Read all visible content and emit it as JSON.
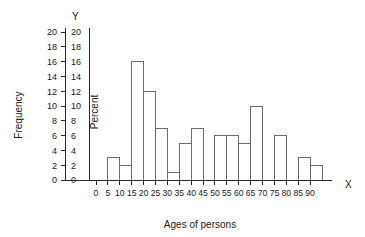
{
  "chart_data": {
    "type": "bar",
    "title": "",
    "subtitle": "",
    "xlabel": "Ages of persons",
    "ylabel": "Frequency",
    "y2label": "Percent",
    "x_axis_letter": "X",
    "y_axis_letter": "Y",
    "grid": false,
    "legend": "none",
    "xlim": [
      0,
      95
    ],
    "ylim": [
      0,
      20
    ],
    "y2lim": [
      0,
      20
    ],
    "x_ticks": [
      0,
      5,
      10,
      15,
      20,
      25,
      30,
      35,
      40,
      45,
      50,
      55,
      60,
      65,
      70,
      75,
      80,
      85,
      90
    ],
    "x_tick_labels": [
      "0",
      "5",
      "10",
      "15",
      "20",
      "25",
      "30",
      "35",
      "40",
      "45",
      "50",
      "55",
      "60",
      "65",
      "70",
      "75",
      "80",
      "85",
      "90"
    ],
    "y_ticks": [
      0,
      2,
      4,
      6,
      8,
      10,
      12,
      14,
      16,
      18,
      20
    ],
    "y_tick_labels": [
      "0",
      "2",
      "4",
      "6",
      "8",
      "10",
      "12",
      "14",
      "16",
      "18",
      "20"
    ],
    "y2_ticks": [
      0,
      2,
      4,
      6,
      8,
      10,
      12,
      14,
      16,
      18,
      20
    ],
    "y2_tick_labels": [
      "0",
      "2",
      "4",
      "6",
      "8",
      "10",
      "12",
      "14",
      "16",
      "18",
      "20"
    ],
    "bin_width": 5,
    "bins": [
      {
        "start": 0,
        "end": 5,
        "label": "0-5",
        "value": 0
      },
      {
        "start": 5,
        "end": 10,
        "label": "5-10",
        "value": 3
      },
      {
        "start": 10,
        "end": 15,
        "label": "10-15",
        "value": 2
      },
      {
        "start": 15,
        "end": 20,
        "label": "15-20",
        "value": 16
      },
      {
        "start": 20,
        "end": 25,
        "label": "20-25",
        "value": 12
      },
      {
        "start": 25,
        "end": 30,
        "label": "25-30",
        "value": 7
      },
      {
        "start": 30,
        "end": 35,
        "label": "30-35",
        "value": 1
      },
      {
        "start": 35,
        "end": 40,
        "label": "35-40",
        "value": 5
      },
      {
        "start": 40,
        "end": 45,
        "label": "40-45",
        "value": 7
      },
      {
        "start": 45,
        "end": 50,
        "label": "45-50",
        "value": 0
      },
      {
        "start": 50,
        "end": 55,
        "label": "50-55",
        "value": 6
      },
      {
        "start": 55,
        "end": 60,
        "label": "55-60",
        "value": 6
      },
      {
        "start": 60,
        "end": 65,
        "label": "60-65",
        "value": 5
      },
      {
        "start": 65,
        "end": 70,
        "label": "65-70",
        "value": 10
      },
      {
        "start": 70,
        "end": 75,
        "label": "70-75",
        "value": 0
      },
      {
        "start": 75,
        "end": 80,
        "label": "75-80",
        "value": 6
      },
      {
        "start": 80,
        "end": 85,
        "label": "80-85",
        "value": 0
      },
      {
        "start": 85,
        "end": 90,
        "label": "85-90",
        "value": 3
      },
      {
        "start": 90,
        "end": 95,
        "label": "90-95",
        "value": 2
      }
    ],
    "categories": [
      "0-5",
      "5-10",
      "10-15",
      "15-20",
      "20-25",
      "25-30",
      "30-35",
      "35-40",
      "40-45",
      "45-50",
      "50-55",
      "55-60",
      "60-65",
      "65-70",
      "70-75",
      "75-80",
      "80-85",
      "85-90",
      "90-95"
    ],
    "values": [
      0,
      3,
      2,
      16,
      12,
      7,
      1,
      5,
      7,
      0,
      6,
      6,
      5,
      10,
      0,
      6,
      0,
      3,
      2
    ],
    "colors": {
      "background": "#ffffff",
      "bar_fill": "#ffffff",
      "bar_stroke": "#6d6d6d",
      "axis": "#2a2a2a",
      "text": "#1a1a1a"
    }
  }
}
